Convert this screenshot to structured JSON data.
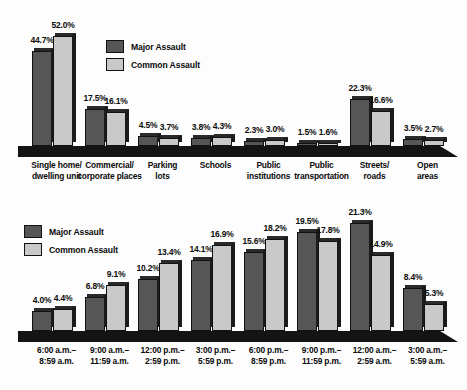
{
  "legend": {
    "major_label": "Major Assault",
    "common_label": "Common Assault",
    "major_color": "#565656",
    "common_color": "#c9c9c9"
  },
  "chart_data": [
    {
      "type": "bar",
      "title": "",
      "xlabel": "",
      "ylabel": "",
      "ylim": [
        0,
        52
      ],
      "grid": false,
      "legend_position": "inside-top-left",
      "categories": [
        "Single home/\ndwelling unit",
        "Commercial/\ncorporate places",
        "Parking\nlots",
        "Schools",
        "Public\ninstitutions",
        "Public\ntransportation",
        "Streets/\nroads",
        "Open areas"
      ],
      "series": [
        {
          "name": "Major Assault",
          "values": [
            44.7,
            17.5,
            4.5,
            3.8,
            2.3,
            1.5,
            22.3,
            3.5
          ],
          "labels": [
            "44.7%",
            "17.5%",
            "4.5%",
            "3.8%",
            "2.3%",
            "1.5%",
            "22.3%",
            "3.5%"
          ]
        },
        {
          "name": "Common Assault",
          "values": [
            52.0,
            16.1,
            3.7,
            4.3,
            3.0,
            1.6,
            16.6,
            2.7
          ],
          "labels": [
            "52.0%",
            "16.1%",
            "3.7%",
            "4.3%",
            "3.0%",
            "1.6%",
            "16.6%",
            "2.7%"
          ]
        }
      ]
    },
    {
      "type": "bar",
      "title": "",
      "xlabel": "",
      "ylabel": "",
      "ylim": [
        0,
        21.3
      ],
      "grid": false,
      "legend_position": "inside-top-left",
      "categories": [
        "6:00 a.m.–\n8:59 a.m.",
        "9:00 a.m.–\n11:59 a.m.",
        "12:00 p.m.–\n2:59 p.m.",
        "3:00 p.m.–\n5:59 p.m.",
        "6:00 p.m.–\n8:59 p.m.",
        "9:00 p.m.–\n11:59 p.m.",
        "12:00 a.m.–\n2:59 a.m.",
        "3:00 a.m.–\n5:59 a.m."
      ],
      "series": [
        {
          "name": "Major Assault",
          "values": [
            4.0,
            6.8,
            10.2,
            14.1,
            15.6,
            19.5,
            21.3,
            8.4
          ],
          "labels": [
            "4.0%",
            "6.8%",
            "10.2%",
            "14.1%",
            "15.6%",
            "19.5%",
            "21.3%",
            "8.4%"
          ]
        },
        {
          "name": "Common Assault",
          "values": [
            4.4,
            9.1,
            13.4,
            16.9,
            18.2,
            17.8,
            14.9,
            5.3
          ],
          "labels": [
            "4.4%",
            "9.1%",
            "13.4%",
            "16.9%",
            "18.2%",
            "17.8%",
            "14.9%",
            "5.3%"
          ]
        }
      ]
    }
  ]
}
